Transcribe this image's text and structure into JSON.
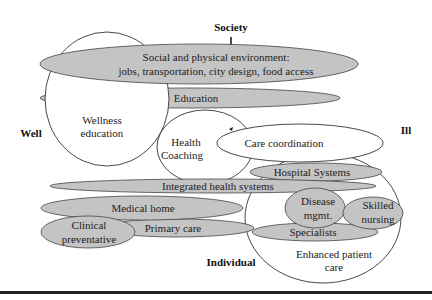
{
  "diagram": {
    "axes": {
      "top": "Society",
      "bottom": "Individual",
      "left": "Well",
      "right": "Ill"
    },
    "colors": {
      "gray_fill": "#c4c4c4",
      "white_fill": "#ffffff",
      "stroke": "#333333",
      "baseline": "#222222"
    },
    "nodes": {
      "social_env": {
        "line1": "Social and physical environment:",
        "line2": "jobs, transportation, city design, food access",
        "fill": "gray"
      },
      "education": {
        "label": "Education",
        "fill": "gray"
      },
      "wellness_education": {
        "line1": "Wellness",
        "line2": "education",
        "fill": "white"
      },
      "health_coaching": {
        "line1": "Health",
        "line2": "Coaching",
        "fill": "white"
      },
      "care_coordination": {
        "label": "Care coordination",
        "fill": "white"
      },
      "integrated_health_systems": {
        "label": "Integrated health systems",
        "fill": "gray"
      },
      "hospital_systems": {
        "label": "Hospital Systems",
        "fill": "gray"
      },
      "medical_home": {
        "label": "Medical home",
        "fill": "gray"
      },
      "primary_care": {
        "label": "Primary care",
        "fill": "gray"
      },
      "clinical_preventative": {
        "line1": "Clinical",
        "line2": "preventative",
        "fill": "gray"
      },
      "disease_mgmt": {
        "line1": "Disease",
        "line2": "mgmt.",
        "fill": "gray"
      },
      "skilled_nursing": {
        "line1": "Skilled",
        "line2": "nursing",
        "fill": "gray"
      },
      "specialists": {
        "label": "Specialists",
        "fill": "gray"
      },
      "enhanced_patient_care": {
        "line1": "Enhanced patient",
        "line2": "care",
        "fill": "white"
      }
    }
  }
}
